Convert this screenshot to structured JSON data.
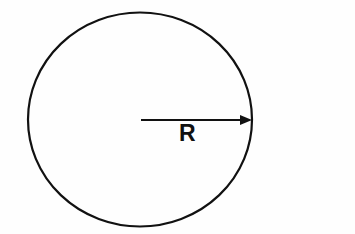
{
  "figure": {
    "background_color": "#fefefe",
    "stroke_color": "#111111",
    "circle": {
      "name": "circle-outline",
      "center_x": 140,
      "center_y": 119.5,
      "radius_x": 112,
      "radius_y": 107,
      "stroke_width": 2.2,
      "fill": "none"
    },
    "radius_arrow": {
      "name": "radius-arrow",
      "start_x": 141,
      "start_y": 120,
      "end_x": 252,
      "end_y": 120,
      "stroke_width": 2,
      "arrowhead_length": 12,
      "arrowhead_half_height": 5
    },
    "radius_label": {
      "text": "R",
      "x": 179,
      "y": 141,
      "font_size": 23,
      "font_weight": "bold"
    }
  }
}
